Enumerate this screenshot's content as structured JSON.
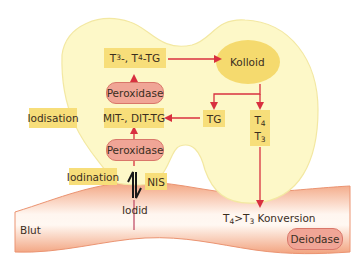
{
  "diagram": {
    "colors": {
      "cell_fill": "#fdf8c8",
      "cell_stroke": "#f3e8a2",
      "label_box": "#f7de7a",
      "colloid": "#f5da6e",
      "enzyme_fill": "#f0a596",
      "enzyme_stroke": "#d9776a",
      "arrow": "#d8303f",
      "vessel_edge": "#f0a07e",
      "vessel_center": "#ffffff"
    },
    "nodes": {
      "t3_t4_tg": {
        "t1": "T",
        "s1": "3",
        "t2": "-, T",
        "s2": "4",
        "t3": "-TG"
      },
      "peroxidase_top": "Peroxidase",
      "mit_dit_tg": "MIT-, DIT-TG",
      "iodisation": "Iodisation",
      "peroxidase_bottom": "Peroxidase",
      "iodination": "Iodination",
      "nis": "NIS",
      "iodid": "Iodid",
      "kolloid": "Kolloid",
      "tg": "TG",
      "t4_t3": {
        "a": "T",
        "a_sub": "4",
        "b": "T",
        "b_sub": "3"
      },
      "blut": "Blut",
      "konversion": {
        "a": "T",
        "a_sub": "4",
        "gt": ">",
        "b": "T",
        "b_sub": "3",
        "text": " Konversion"
      },
      "deiodase": "Deiodase"
    },
    "edges": [
      {
        "from": "Peroxidase (bottom)",
        "to": "MIT-, DIT-TG"
      },
      {
        "from": "MIT-, DIT-TG",
        "to": "T3-, T4-TG"
      },
      {
        "from": "T3-, T4-TG",
        "to": "Kolloid"
      },
      {
        "from": "Kolloid",
        "to": "TG"
      },
      {
        "from": "Kolloid",
        "to": "T4 T3"
      },
      {
        "from": "TG",
        "to": "MIT-, DIT-TG"
      },
      {
        "from": "T4 T3",
        "to": "T4>T3 Konversion"
      },
      {
        "from": "Iodid",
        "to": "Peroxidase (bottom)",
        "type": "equilibrium"
      }
    ]
  }
}
